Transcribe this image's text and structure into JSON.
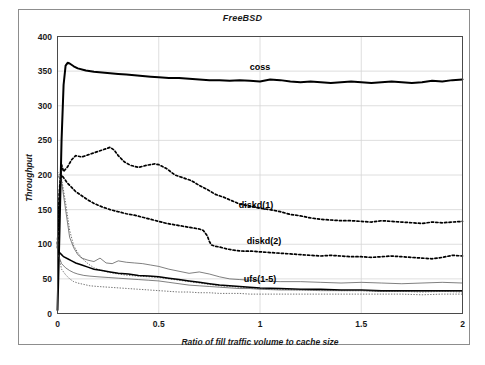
{
  "chart_data": {
    "type": "line",
    "title": "FreeBSD",
    "xlabel": "Ratio of fill traffic volume to cache size",
    "ylabel": "Throughput",
    "xlim": [
      0,
      2
    ],
    "ylim": [
      0,
      400
    ],
    "xticks": [
      "0",
      "0.5",
      "1",
      "1.5",
      "2"
    ],
    "xtick_values": [
      0,
      0.5,
      1,
      1.5,
      2
    ],
    "yticks": [
      "0",
      "50",
      "100",
      "150",
      "200",
      "250",
      "300",
      "350",
      "400"
    ],
    "ytick_values": [
      0,
      50,
      100,
      150,
      200,
      250,
      300,
      350,
      400
    ],
    "grid": true,
    "legend_position": "inline-annotations",
    "annotations": [
      {
        "label": "coss",
        "x": 1.0,
        "y": 352
      },
      {
        "label": "diskd(1)",
        "x": 0.98,
        "y": 152
      },
      {
        "label": "diskd(2)",
        "x": 1.02,
        "y": 101
      },
      {
        "label": "ufs(1-5)",
        "x": 1.0,
        "y": 46
      }
    ],
    "series": [
      {
        "name": "coss",
        "style": "solid-thick",
        "x": [
          0,
          0.01,
          0.02,
          0.03,
          0.04,
          0.05,
          0.06,
          0.08,
          0.1,
          0.14,
          0.18,
          0.22,
          0.26,
          0.3,
          0.34,
          0.38,
          0.42,
          0.46,
          0.5,
          0.55,
          0.6,
          0.65,
          0.7,
          0.75,
          0.8,
          0.85,
          0.9,
          0.95,
          1.0,
          1.05,
          1.1,
          1.15,
          1.2,
          1.25,
          1.3,
          1.35,
          1.4,
          1.45,
          1.5,
          1.55,
          1.6,
          1.65,
          1.7,
          1.75,
          1.8,
          1.85,
          1.9,
          1.95,
          2.0
        ],
        "values": [
          5,
          120,
          250,
          330,
          358,
          362,
          361,
          357,
          354,
          351,
          349,
          348,
          347,
          346,
          345,
          344,
          343,
          342,
          341,
          340,
          340,
          339,
          338,
          337,
          337,
          336,
          337,
          336,
          335,
          338,
          337,
          335,
          334,
          335,
          334,
          333,
          334,
          335,
          334,
          333,
          334,
          335,
          334,
          333,
          334,
          336,
          335,
          337,
          338
        ]
      },
      {
        "name": "diskd(1)",
        "style": "dotted",
        "x": [
          0,
          0.01,
          0.02,
          0.03,
          0.05,
          0.07,
          0.09,
          0.12,
          0.15,
          0.18,
          0.21,
          0.24,
          0.26,
          0.28,
          0.3,
          0.33,
          0.36,
          0.4,
          0.44,
          0.48,
          0.5,
          0.54,
          0.58,
          0.62,
          0.66,
          0.7,
          0.74,
          0.78,
          0.82,
          0.86,
          0.9,
          0.95,
          1.0,
          1.05,
          1.1,
          1.15,
          1.2,
          1.25,
          1.3,
          1.35,
          1.4,
          1.45,
          1.5,
          1.55,
          1.6,
          1.65,
          1.7,
          1.75,
          1.8,
          1.85,
          1.9,
          1.95,
          2.0
        ],
        "values": [
          100,
          180,
          215,
          205,
          212,
          222,
          228,
          226,
          229,
          232,
          235,
          238,
          240,
          236,
          228,
          219,
          214,
          211,
          214,
          216,
          215,
          209,
          200,
          196,
          192,
          185,
          179,
          172,
          168,
          163,
          158,
          155,
          152,
          150,
          147,
          143,
          141,
          138,
          136,
          135,
          134,
          134,
          133,
          132,
          134,
          133,
          132,
          131,
          130,
          132,
          131,
          132,
          133
        ]
      },
      {
        "name": "diskd(2)",
        "style": "dotted",
        "x": [
          0,
          0.01,
          0.02,
          0.03,
          0.05,
          0.07,
          0.09,
          0.12,
          0.15,
          0.18,
          0.22,
          0.26,
          0.3,
          0.34,
          0.38,
          0.42,
          0.46,
          0.5,
          0.54,
          0.58,
          0.62,
          0.66,
          0.7,
          0.72,
          0.74,
          0.75,
          0.76,
          0.78,
          0.8,
          0.84,
          0.88,
          0.92,
          0.96,
          1.0,
          1.05,
          1.1,
          1.15,
          1.2,
          1.25,
          1.3,
          1.35,
          1.4,
          1.45,
          1.5,
          1.55,
          1.6,
          1.65,
          1.7,
          1.75,
          1.8,
          1.85,
          1.9,
          1.95,
          2.0
        ],
        "values": [
          95,
          175,
          200,
          196,
          188,
          182,
          176,
          170,
          164,
          159,
          154,
          150,
          147,
          144,
          142,
          139,
          136,
          133,
          130,
          128,
          126,
          124,
          122,
          120,
          112,
          104,
          99,
          97,
          96,
          93,
          91,
          90,
          90,
          89,
          88,
          87,
          86,
          85,
          84,
          83,
          84,
          83,
          82,
          82,
          81,
          82,
          83,
          82,
          81,
          80,
          79,
          81,
          84,
          83
        ]
      },
      {
        "name": "ufs(1)",
        "style": "thin",
        "x": [
          0,
          0.02,
          0.04,
          0.06,
          0.08,
          0.1,
          0.12,
          0.15,
          0.18,
          0.21,
          0.24,
          0.27,
          0.3,
          0.34,
          0.38,
          0.42,
          0.46,
          0.5,
          0.55,
          0.6,
          0.65,
          0.7,
          0.75,
          0.8,
          0.85,
          0.9,
          0.95,
          1.0,
          1.1,
          1.2,
          1.3,
          1.4,
          1.5,
          1.6,
          1.7,
          1.8,
          1.9,
          2.0
        ],
        "values": [
          200,
          190,
          150,
          110,
          95,
          85,
          80,
          77,
          75,
          80,
          73,
          72,
          76,
          74,
          73,
          72,
          70,
          68,
          64,
          61,
          58,
          60,
          57,
          53,
          50,
          49,
          48,
          47,
          46,
          46,
          45,
          44,
          45,
          44,
          43,
          44,
          45,
          44
        ]
      },
      {
        "name": "ufs(2)",
        "style": "dotted-thin",
        "x": [
          0,
          0.02,
          0.04,
          0.06,
          0.08,
          0.1,
          0.12,
          0.15,
          0.18,
          0.22,
          0.26,
          0.3,
          0.35,
          0.4,
          0.45,
          0.5,
          0.55,
          0.6,
          0.65,
          0.7,
          0.75,
          0.8,
          0.85,
          0.9,
          0.95,
          1.0,
          1.1,
          1.2,
          1.3,
          1.4,
          1.5,
          1.6,
          1.7,
          1.8,
          1.9,
          2.0
        ],
        "values": [
          205,
          195,
          160,
          120,
          98,
          88,
          80,
          72,
          66,
          62,
          59,
          57,
          55,
          54,
          53,
          52,
          50,
          48,
          46,
          44,
          42,
          40,
          39,
          38,
          37,
          36,
          35,
          34,
          34,
          33,
          33,
          32,
          32,
          31,
          32,
          31
        ]
      },
      {
        "name": "ufs(3)",
        "style": "bold-thin",
        "x": [
          0,
          0.01,
          0.02,
          0.03,
          0.05,
          0.07,
          0.09,
          0.12,
          0.15,
          0.18,
          0.22,
          0.26,
          0.3,
          0.35,
          0.4,
          0.45,
          0.5,
          0.55,
          0.6,
          0.65,
          0.7,
          0.75,
          0.8,
          0.85,
          0.9,
          0.95,
          1.0,
          1.1,
          1.2,
          1.3,
          1.4,
          1.5,
          1.6,
          1.7,
          1.8,
          1.9,
          2.0
        ],
        "values": [
          90,
          88,
          85,
          82,
          79,
          76,
          73,
          70,
          67,
          64,
          62,
          60,
          58,
          57,
          55,
          54,
          53,
          51,
          49,
          47,
          45,
          43,
          41,
          40,
          39,
          38,
          37,
          36,
          35,
          35,
          34,
          34,
          33,
          33,
          33,
          33,
          33
        ]
      },
      {
        "name": "ufs(4)",
        "style": "thin",
        "x": [
          0,
          0.01,
          0.02,
          0.04,
          0.06,
          0.08,
          0.1,
          0.13,
          0.16,
          0.2,
          0.25,
          0.3,
          0.35,
          0.4,
          0.45,
          0.5,
          0.55,
          0.6,
          0.65,
          0.7,
          0.75,
          0.8,
          0.85,
          0.9,
          0.95,
          1.0,
          1.1,
          1.2,
          1.3,
          1.4,
          1.5,
          1.6,
          1.7,
          1.8,
          1.9,
          2.0
        ],
        "values": [
          86,
          80,
          72,
          66,
          62,
          59,
          57,
          55,
          54,
          53,
          52,
          51,
          50,
          49,
          48,
          47,
          45,
          43,
          41,
          40,
          39,
          38,
          37,
          36,
          36,
          35,
          34,
          34,
          33,
          33,
          33,
          32,
          32,
          32,
          32,
          32
        ]
      },
      {
        "name": "ufs(5)",
        "style": "dotted-thin",
        "x": [
          0,
          0.01,
          0.02,
          0.04,
          0.06,
          0.08,
          0.1,
          0.13,
          0.16,
          0.2,
          0.25,
          0.3,
          0.35,
          0.4,
          0.45,
          0.5,
          0.55,
          0.6,
          0.65,
          0.7,
          0.75,
          0.8,
          0.85,
          0.9,
          0.95,
          1.0,
          1.1,
          1.2,
          1.3,
          1.4,
          1.5,
          1.6,
          1.7,
          1.8,
          1.9,
          2.0
        ],
        "values": [
          88,
          78,
          64,
          56,
          50,
          46,
          44,
          42,
          40,
          39,
          38,
          37,
          36,
          35,
          34,
          33,
          32,
          31,
          31,
          30,
          30,
          29,
          29,
          29,
          28,
          28,
          28,
          28,
          28,
          28,
          28,
          28,
          28,
          27,
          28,
          28
        ]
      }
    ]
  }
}
